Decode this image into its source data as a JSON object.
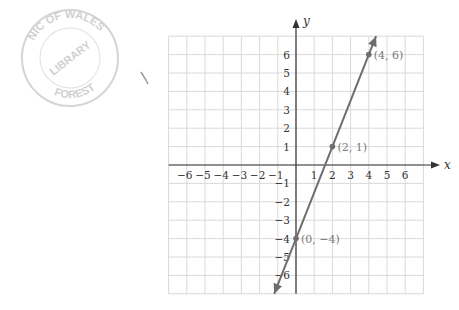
{
  "stamp": {
    "top_text": "NIC OF WALES",
    "middle_text": "LIBRARY",
    "bottom_text": "FOREST"
  },
  "chart_data": {
    "type": "line",
    "title": "",
    "xlabel": "x",
    "ylabel": "y",
    "xlim": [
      -7,
      7
    ],
    "ylim": [
      -7,
      7
    ],
    "grid": true,
    "x_ticks": [
      -6,
      -5,
      -4,
      -3,
      -2,
      -1,
      1,
      2,
      3,
      4,
      5,
      6
    ],
    "y_ticks": [
      -6,
      -5,
      -4,
      -3,
      -2,
      -1,
      1,
      2,
      3,
      4,
      5,
      6
    ],
    "x_tick_labels": [
      "−6",
      "−5",
      "−4",
      "−3",
      "−2",
      "−1",
      "1",
      "2",
      "3",
      "4",
      "5",
      "6"
    ],
    "y_tick_labels": [
      "−6",
      "−5",
      "−4",
      "−3",
      "−2",
      "−1",
      "1",
      "2",
      "3",
      "4",
      "5",
      "6"
    ],
    "series": [
      {
        "name": "y = 2.5x − 4",
        "x": [
          -1.2,
          4.4
        ],
        "y": [
          -7,
          7
        ],
        "color": "#6e6e6e",
        "arrows_both_ends": true
      }
    ],
    "points": [
      {
        "x": 4,
        "y": 6,
        "label": "(4, 6)"
      },
      {
        "x": 2,
        "y": 1,
        "label": "(2, 1)"
      },
      {
        "x": 0,
        "y": -4,
        "label": "(0, −4)"
      }
    ],
    "colors": {
      "grid": "#d9d9d9",
      "axis": "#333333",
      "line": "#6e6e6e",
      "point": "#6e6e6e",
      "point_label": "#7a7a7a",
      "tick_label": "#333333"
    }
  }
}
